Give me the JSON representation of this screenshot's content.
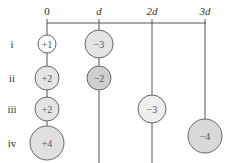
{
  "columns": [
    {
      "label": "0",
      "x": 47,
      "italic": false
    },
    {
      "label": "d",
      "x": 99,
      "italic": true
    },
    {
      "label": "2d",
      "x": 152,
      "italic": true
    },
    {
      "label": "3d",
      "x": 205,
      "italic": true
    }
  ],
  "rows": [
    {
      "label": "i",
      "y": 44
    },
    {
      "label": "ii",
      "y": 78
    },
    {
      "label": "iii",
      "y": 109
    },
    {
      "label": "iv",
      "y": 143
    }
  ],
  "charges": [
    {
      "row": "i",
      "column": "0",
      "value": "+1",
      "cx": 47,
      "cy": 44,
      "r": 9,
      "fill": "#ffffff"
    },
    {
      "row": "i",
      "column": "d",
      "value": "−3",
      "cx": 99,
      "cy": 44,
      "r": 14,
      "fill": "#e4e4e4"
    },
    {
      "row": "ii",
      "column": "0",
      "value": "+2",
      "cx": 47,
      "cy": 78,
      "r": 12,
      "fill": "#e4e4e4"
    },
    {
      "row": "ii",
      "column": "d",
      "value": "−2",
      "cx": 99,
      "cy": 78,
      "r": 12,
      "fill": "#cfcfcf"
    },
    {
      "row": "iii",
      "column": "0",
      "value": "+2",
      "cx": 47,
      "cy": 109,
      "r": 12,
      "fill": "#e4e4e4"
    },
    {
      "row": "iii",
      "column": "2d",
      "value": "−3",
      "cx": 152,
      "cy": 109,
      "r": 14,
      "fill": "#eeeeee"
    },
    {
      "row": "iv",
      "column": "0",
      "value": "+4",
      "cx": 47,
      "cy": 143,
      "r": 17,
      "fill": "#e0e0e0"
    },
    {
      "row": "iv",
      "column": "3d",
      "value": "−4",
      "cx": 205,
      "cy": 136,
      "r": 17,
      "fill": "#d9d9d9"
    }
  ],
  "colors": {
    "line": "#555555",
    "stroke": "#666666"
  }
}
